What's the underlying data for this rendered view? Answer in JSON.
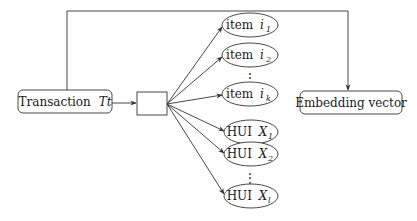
{
  "diagram": {
    "source_node": {
      "label": "Transaction",
      "var": "Tt"
    },
    "splitter_node": {
      "label": ""
    },
    "target_node": {
      "label": "Embedding vector"
    },
    "item_nodes": [
      {
        "prefix": "item",
        "var": "i",
        "sub": "1"
      },
      {
        "prefix": "item",
        "var": "i",
        "sub": "2"
      },
      {
        "prefix": "item",
        "var": "i",
        "sub": "k"
      }
    ],
    "hui_nodes": [
      {
        "prefix": "HUI",
        "var": "X",
        "sub": "1"
      },
      {
        "prefix": "HUI",
        "var": "X",
        "sub": "2"
      },
      {
        "prefix": "HUI",
        "var": "X",
        "sub": "l"
      }
    ],
    "ellipsis": "⋮",
    "edges": [
      {
        "from": "Transaction Tt",
        "to": "splitter"
      },
      {
        "from": "splitter",
        "to": "item i1"
      },
      {
        "from": "splitter",
        "to": "item i2"
      },
      {
        "from": "splitter",
        "to": "item ik"
      },
      {
        "from": "splitter",
        "to": "HUI X1"
      },
      {
        "from": "splitter",
        "to": "HUI X2"
      },
      {
        "from": "splitter",
        "to": "HUI Xl"
      },
      {
        "from": "Transaction Tt",
        "to": "Embedding vector"
      }
    ]
  }
}
